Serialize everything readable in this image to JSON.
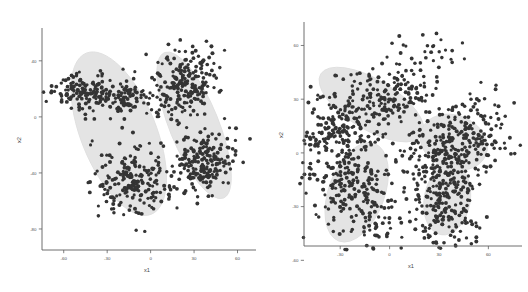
{
  "figure": {
    "name": "two-panel-gaussian-mixture-scatter",
    "background": "#ffffff",
    "point_color": "#2d2d2d",
    "hull_color": "#e4e4e4",
    "axis_color": "#5a5a5a"
  },
  "panels": [
    {
      "id": "left",
      "xlabel": "x1",
      "ylabel": "x2",
      "xticks": [
        "-60",
        "-30",
        "0",
        "30",
        "60"
      ],
      "yticks": [
        "40",
        "0",
        "-40",
        "-80"
      ],
      "n_clusters": 2,
      "n_subclusters": 4
    },
    {
      "id": "right",
      "xlabel": "x1",
      "ylabel": "x2",
      "xticks": [
        "-30",
        "0",
        "30",
        "60"
      ],
      "yticks": [
        "60",
        "30",
        "0",
        "-30",
        "-60"
      ],
      "n_clusters": 4,
      "n_subclusters": 4
    }
  ],
  "chart_data": {
    "type": "scatter",
    "title": "",
    "subplots": [
      {
        "id": "left",
        "xlabel": "x1",
        "ylabel": "x2",
        "xlim": [
          -75,
          70
        ],
        "ylim": [
          -95,
          62
        ],
        "xticks": [
          -60,
          -30,
          0,
          30,
          60
        ],
        "yticks": [
          40,
          0,
          -40,
          -80
        ],
        "grid": false,
        "legend": null,
        "components": [
          {
            "name": "component-1",
            "ellipse": {
              "cx": -22,
              "cy": -12,
              "rx": 26,
              "ry": 62,
              "angle": 22
            },
            "subclusters": [
              {
                "name": "cluster-1a",
                "cx": -36,
                "cy": 16,
                "n": 230,
                "sx": 20,
                "sy": 7,
                "angle": 8
              },
              {
                "name": "cluster-1b",
                "cx": -12,
                "cy": -46,
                "n": 210,
                "sx": 14,
                "sy": 13,
                "angle": 30
              }
            ]
          },
          {
            "name": "component-2",
            "ellipse": {
              "cx": 30,
              "cy": -6,
              "rx": 17,
              "ry": 56,
              "angle": 22
            },
            "subclusters": [
              {
                "name": "cluster-2a",
                "cx": 24,
                "cy": 24,
                "n": 200,
                "sx": 11,
                "sy": 14,
                "angle": 25
              },
              {
                "name": "cluster-2b",
                "cx": 38,
                "cy": -34,
                "n": 195,
                "sx": 10,
                "sy": 13,
                "angle": 25
              }
            ]
          }
        ]
      },
      {
        "id": "right",
        "xlabel": "x1",
        "ylabel": "x2",
        "xlim": [
          -52,
          78
        ],
        "ylim": [
          -52,
          72
        ],
        "xticks": [
          -30,
          0,
          30,
          60
        ],
        "yticks": [
          60,
          30,
          0,
          -30,
          -60
        ],
        "grid": false,
        "legend": null,
        "components": [
          {
            "name": "component-1",
            "ellipse": {
              "cx": -11,
              "cy": 27,
              "rx": 36,
              "ry": 14,
              "angle": -31
            },
            "subclusters": [
              {
                "name": "cluster-1",
                "cx": -11,
                "cy": 27,
                "n": 330,
                "sx": 30,
                "sy": 10,
                "angle": -31
              }
            ]
          },
          {
            "name": "component-2",
            "ellipse": {
              "cx": -20,
              "cy": -22,
              "rx": 17,
              "ry": 29,
              "angle": -20
            },
            "subclusters": [
              {
                "name": "cluster-2",
                "cx": -20,
                "cy": -22,
                "n": 320,
                "sx": 13,
                "sy": 24,
                "angle": -20
              }
            ]
          },
          {
            "name": "component-3",
            "ellipse": {
              "cx": 39,
              "cy": 6,
              "rx": 21,
              "ry": 15,
              "angle": -22
            },
            "subclusters": [
              {
                "name": "cluster-3",
                "cx": 39,
                "cy": 6,
                "n": 270,
                "sx": 17,
                "sy": 11,
                "angle": -22
              }
            ]
          },
          {
            "name": "component-4",
            "ellipse": {
              "cx": 35,
              "cy": -26,
              "rx": 14,
              "ry": 20,
              "angle": -10
            },
            "subclusters": [
              {
                "name": "cluster-4",
                "cx": 35,
                "cy": -26,
                "n": 235,
                "sx": 11,
                "sy": 16,
                "angle": -10
              }
            ]
          }
        ]
      }
    ]
  }
}
